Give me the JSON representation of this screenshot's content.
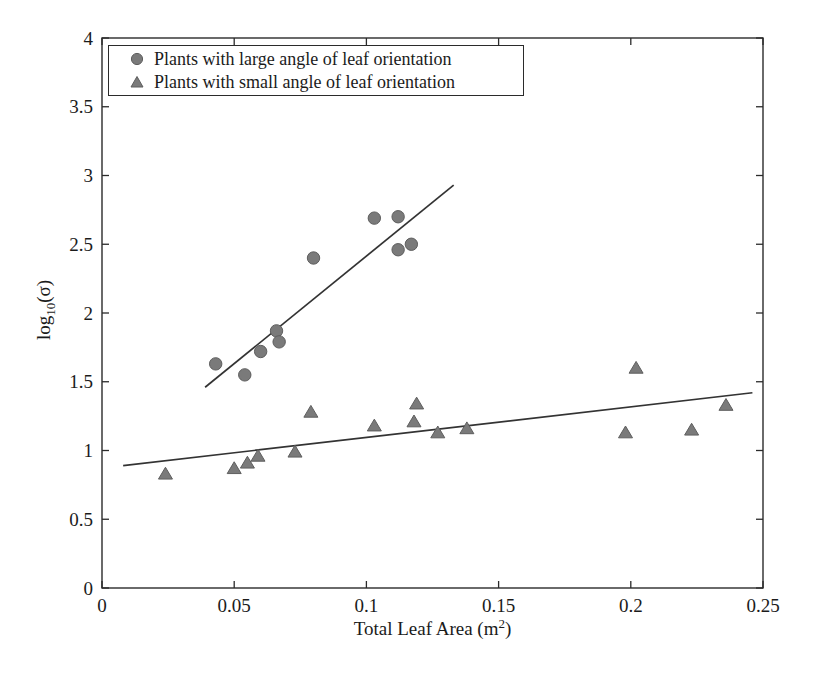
{
  "figure": {
    "background": "#ffffff"
  },
  "chart_data": {
    "type": "scatter",
    "title": "",
    "xlabel": {
      "pre": "Total Leaf Area (m",
      "sup": "2",
      "post": ")"
    },
    "ylabel": {
      "pre": "log",
      "sub": "10",
      "post": "(σ)"
    },
    "xlim": [
      0,
      0.25
    ],
    "ylim": [
      0,
      4
    ],
    "x_ticks": [
      0,
      0.05,
      0.1,
      0.15,
      0.2,
      0.25
    ],
    "x_tick_labels": [
      "0",
      "0.05",
      "0.1",
      "0.15",
      "0.2",
      "0.25"
    ],
    "y_ticks": [
      0,
      0.5,
      1,
      1.5,
      2,
      2.5,
      3,
      3.5,
      4
    ],
    "y_tick_labels": [
      "0",
      "0.5",
      "1",
      "1.5",
      "2",
      "2.5",
      "3",
      "3.5",
      "4"
    ],
    "grid": false,
    "legend_position": "top-left",
    "axis_color": "#2b2b2b",
    "line_color": "#333333",
    "text_color": "#1b1b1b",
    "series": [
      {
        "name": "Plants with large angle of leaf orientation",
        "marker": "circle",
        "marker_color": "#7a7a7a",
        "marker_edge_color": "#5e5e5e",
        "points": [
          [
            0.043,
            1.63
          ],
          [
            0.054,
            1.55
          ],
          [
            0.06,
            1.72
          ],
          [
            0.066,
            1.87
          ],
          [
            0.067,
            1.79
          ],
          [
            0.08,
            2.4
          ],
          [
            0.103,
            2.69
          ],
          [
            0.112,
            2.7
          ],
          [
            0.112,
            2.46
          ],
          [
            0.117,
            2.5
          ]
        ],
        "trend_line": {
          "x1": 0.039,
          "y1": 1.46,
          "x2": 0.133,
          "y2": 2.93
        }
      },
      {
        "name": "Plants with small angle of leaf orientation",
        "marker": "triangle",
        "marker_color": "#7a7a7a",
        "marker_edge_color": "#5e5e5e",
        "points": [
          [
            0.024,
            0.83
          ],
          [
            0.05,
            0.87
          ],
          [
            0.055,
            0.91
          ],
          [
            0.059,
            0.96
          ],
          [
            0.073,
            0.99
          ],
          [
            0.079,
            1.28
          ],
          [
            0.103,
            1.18
          ],
          [
            0.118,
            1.21
          ],
          [
            0.119,
            1.34
          ],
          [
            0.127,
            1.13
          ],
          [
            0.138,
            1.16
          ],
          [
            0.198,
            1.13
          ],
          [
            0.202,
            1.6
          ],
          [
            0.223,
            1.15
          ],
          [
            0.236,
            1.33
          ]
        ],
        "trend_line": {
          "x1": 0.008,
          "y1": 0.89,
          "x2": 0.246,
          "y2": 1.42
        }
      }
    ]
  }
}
